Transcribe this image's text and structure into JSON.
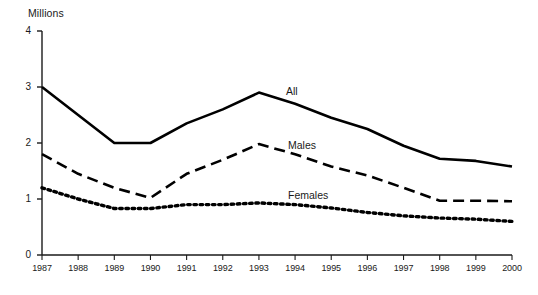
{
  "chart_data": {
    "type": "line",
    "title": "",
    "unit_label": "Millions",
    "xlabel": "",
    "ylabel": "",
    "categories": [
      "1987",
      "1988",
      "1989",
      "1990",
      "1991",
      "1992",
      "1993",
      "1994",
      "1995",
      "1996",
      "1997",
      "1998",
      "1999",
      "2000"
    ],
    "x": [
      1987,
      1988,
      1989,
      1990,
      1991,
      1992,
      1993,
      1994,
      1995,
      1996,
      1997,
      1998,
      1999,
      2000
    ],
    "xlim": [
      1987,
      2000
    ],
    "ylim": [
      0,
      4
    ],
    "y_ticks": [
      0,
      1,
      2,
      3,
      4
    ],
    "y_tick_labels": [
      "0",
      "1",
      "2",
      "3",
      "4"
    ],
    "grid": false,
    "legend_position": "inline-right-of-lines",
    "series": [
      {
        "name": "All",
        "style": "solid",
        "color": "#000000",
        "values": [
          3.0,
          2.5,
          2.0,
          2.0,
          2.35,
          2.6,
          2.9,
          2.7,
          2.45,
          2.25,
          1.95,
          1.72,
          1.68,
          1.58
        ]
      },
      {
        "name": "Males",
        "style": "dashed",
        "color": "#000000",
        "values": [
          1.8,
          1.45,
          1.2,
          1.02,
          1.45,
          1.7,
          1.98,
          1.8,
          1.58,
          1.42,
          1.2,
          0.97,
          0.97,
          0.96
        ]
      },
      {
        "name": "Females",
        "style": "dotted",
        "color": "#000000",
        "values": [
          1.2,
          1.0,
          0.83,
          0.83,
          0.9,
          0.9,
          0.93,
          0.9,
          0.84,
          0.76,
          0.7,
          0.66,
          0.64,
          0.6
        ]
      }
    ]
  },
  "axis": {
    "y_unit": "Millions"
  },
  "labels": {
    "all": "All",
    "males": "Males",
    "females": "Females"
  }
}
